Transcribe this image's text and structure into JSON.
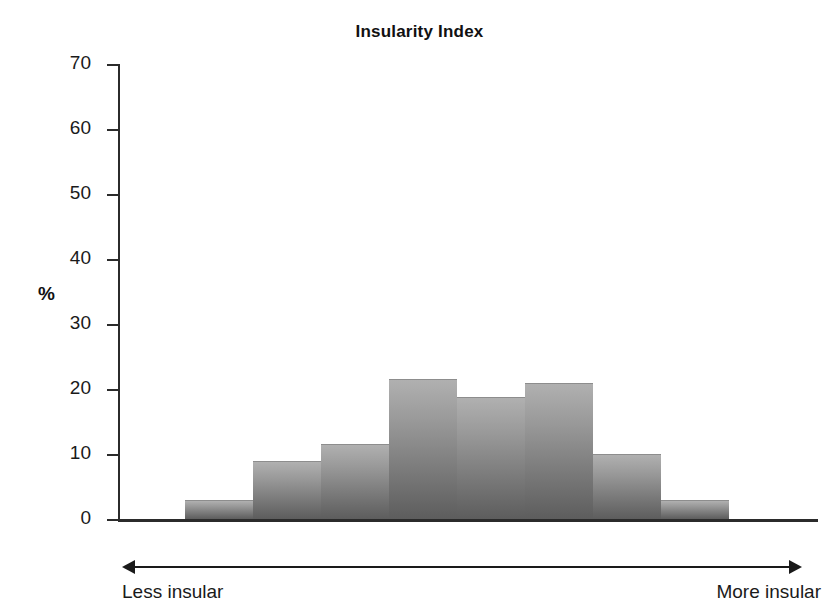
{
  "chart_data": {
    "type": "bar",
    "title": "Insularity Index",
    "xlabel": "",
    "ylabel": "%",
    "ylim": [
      0,
      70
    ],
    "yticks": [
      0,
      10,
      20,
      30,
      40,
      50,
      60,
      70
    ],
    "grid": false,
    "legend": null,
    "categories": [
      "1",
      "2",
      "3",
      "4",
      "5",
      "6",
      "7",
      "8"
    ],
    "values": [
      3,
      9,
      11.5,
      21.5,
      18.8,
      21,
      10,
      3
    ],
    "axis_annotations": {
      "left_end": "Less insular",
      "right_end": "More insular"
    },
    "bar_color_top": "#b0b0b0",
    "bar_color_bottom": "#5d5d5d",
    "axis_color": "#2b2b2b",
    "text_color": "#1a1a1a"
  },
  "icons": {
    "arrow_left": "arrow-left-icon",
    "arrow_right": "arrow-right-icon"
  }
}
